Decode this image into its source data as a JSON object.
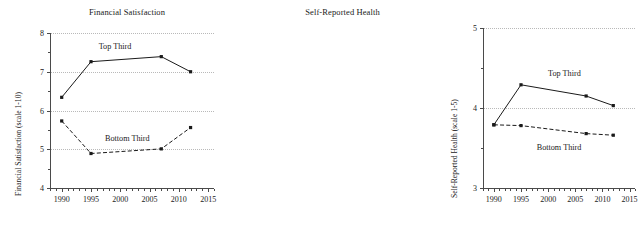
{
  "figure": {
    "background": "#ffffff",
    "line_color": "#1a1a1a",
    "grid_color": "#b9b9b9",
    "axis_color": "#4a4a4a"
  },
  "chart_data": [
    {
      "type": "line",
      "panel": "left",
      "title": "Financial Satisfaction",
      "xlabel": "",
      "ylabel": "Financial Satisfaction (scale 1-10)",
      "x": [
        1990,
        1995,
        2007,
        2012
      ],
      "xlim": [
        1988,
        2016
      ],
      "ylim": [
        4,
        8
      ],
      "xticks": [
        1990,
        1995,
        2000,
        2005,
        2010,
        2015
      ],
      "xticklabels": [
        "1990",
        "1995",
        "2000",
        "2005",
        "2010",
        "2015"
      ],
      "yticks": [
        4,
        5,
        6,
        7,
        8
      ],
      "yticklabels": [
        "4",
        "5",
        "6",
        "7",
        "8"
      ],
      "grid": true,
      "grid_axis": "y",
      "legend": "none",
      "series": [
        {
          "name": "Top Third",
          "style": "solid",
          "marker": "square",
          "values": [
            6.34,
            7.26,
            7.39,
            7.0
          ],
          "annotation": {
            "text": "Top Third",
            "x": 1999.1,
            "y": 7.62
          }
        },
        {
          "name": "Bottom Third",
          "style": "dashed",
          "marker": "square",
          "values": [
            5.73,
            4.89,
            5.01,
            5.56
          ],
          "annotation": {
            "text": "Bottom Third",
            "x": 2001.2,
            "y": 5.23
          }
        }
      ]
    },
    {
      "type": "line",
      "panel": "right",
      "title": "Self-Reported Health",
      "xlabel": "",
      "ylabel": "Self-Reported Health (scale 1-5)",
      "x": [
        1990,
        1995,
        2007,
        2012
      ],
      "xlim": [
        1988,
        2016
      ],
      "ylim": [
        3,
        5
      ],
      "xticks": [
        1990,
        1995,
        2000,
        2005,
        2010,
        2015
      ],
      "xticklabels": [
        "1990",
        "1995",
        "2000",
        "2005",
        "2010",
        "2015"
      ],
      "yticks": [
        3,
        4,
        5
      ],
      "yticklabels": [
        "3",
        "4",
        "5"
      ],
      "grid": true,
      "grid_axis": "y",
      "legend": "none",
      "series": [
        {
          "name": "Top Third",
          "style": "solid",
          "marker": "square",
          "values": [
            3.79,
            4.29,
            4.15,
            4.03
          ],
          "annotation": {
            "text": "Top Third",
            "x": 2003.0,
            "y": 4.41
          }
        },
        {
          "name": "Bottom Third",
          "style": "dashed",
          "marker": "square",
          "values": [
            3.79,
            3.78,
            3.68,
            3.66
          ],
          "annotation": {
            "text": "Bottom Third",
            "x": 2002.0,
            "y": 3.49
          }
        }
      ]
    }
  ]
}
